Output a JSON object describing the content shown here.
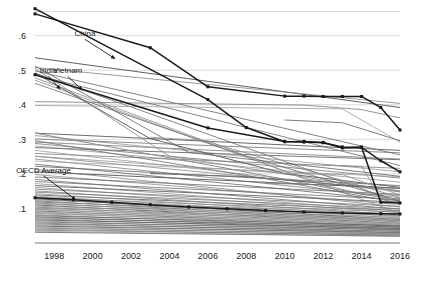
{
  "chart_data": {
    "type": "line",
    "title": "",
    "subtitle": "",
    "xlabel": "",
    "ylabel": "",
    "xlim": [
      1997,
      2016
    ],
    "ylim": [
      0,
      0.68
    ],
    "grid": true,
    "grid_axis": "y",
    "legend_position": "none",
    "annotations_are_inline_labels": true,
    "x": [
      1997,
      1998,
      1999,
      2000,
      2001,
      2002,
      2003,
      2004,
      2005,
      2006,
      2007,
      2008,
      2009,
      2010,
      2011,
      2012,
      2013,
      2014,
      2015,
      2016
    ],
    "xticks": [
      1998,
      2000,
      2002,
      2004,
      2006,
      2008,
      2010,
      2012,
      2014,
      2016
    ],
    "xticklabels": [
      "1998",
      "2000",
      "2002",
      "2004",
      "2006",
      "2008",
      "2010",
      "2012",
      "2014",
      "2016"
    ],
    "yticks": [
      0.1,
      0.2,
      0.3,
      0.4,
      0.5,
      0.6
    ],
    "yticklabels": [
      ".1",
      ".2",
      ".3",
      ".4",
      ".5",
      ".6"
    ],
    "highlight_color": "#1a1a1a",
    "background_color": "#9a9a9a",
    "series": [
      {
        "name": "China",
        "highlight": true,
        "marker": "square",
        "label": "China",
        "label_x": 1999.6,
        "label_y": 0.598,
        "arrow_to_x": 2001.15,
        "arrow_to_y": 0.534,
        "x": [
          1997,
          2003,
          2006,
          2010,
          2011,
          2012,
          2013,
          2014,
          2015,
          2016
        ],
        "values": [
          0.663,
          0.565,
          0.452,
          0.425,
          0.425,
          0.424,
          0.424,
          0.424,
          0.392,
          0.327
        ]
      },
      {
        "name": "Vietnam",
        "highlight": true,
        "marker": "square",
        "label": "Vietnam",
        "label_x": 1998.7,
        "label_y": 0.491,
        "arrow_to_x": 1999.45,
        "arrow_to_y": 0.443,
        "x": [
          1997,
          2006,
          2008,
          2010,
          2011,
          2012,
          2013,
          2014,
          2015,
          2016
        ],
        "values": [
          0.678,
          0.415,
          0.334,
          0.293,
          0.294,
          0.291,
          0.275,
          0.277,
          0.118,
          0.116
        ]
      },
      {
        "name": "India",
        "highlight": true,
        "marker": "square",
        "label": "India",
        "label_x": 1997.7,
        "label_y": 0.492,
        "arrow_to_x": 1998.3,
        "arrow_to_y": 0.446,
        "x": [
          1997,
          2006,
          2010,
          2011,
          2012,
          2013,
          2014,
          2015,
          2016
        ],
        "values": [
          0.487,
          0.333,
          0.294,
          0.292,
          0.29,
          0.278,
          0.277,
          0.238,
          0.206
        ]
      },
      {
        "name": "OECD Average",
        "highlight": true,
        "marker": "square",
        "label": "OECD Average",
        "label_x": 1997.45,
        "label_y": 0.203,
        "arrow_to_x": 1999.1,
        "arrow_to_y": 0.126,
        "x": [
          1997,
          1999,
          2001,
          2003,
          2005,
          2007,
          2009,
          2011,
          2013,
          2015,
          2016
        ],
        "values": [
          0.131,
          0.125,
          0.118,
          0.111,
          0.104,
          0.099,
          0.094,
          0.09,
          0.087,
          0.085,
          0.084
        ]
      }
    ],
    "background_series": [
      {
        "x": [
          1997,
          2016
        ],
        "values": [
          0.536,
          0.392
        ]
      },
      {
        "x": [
          1997,
          2016
        ],
        "values": [
          0.508,
          0.404
        ]
      },
      {
        "x": [
          1997,
          2016
        ],
        "values": [
          0.498,
          0.255
        ]
      },
      {
        "x": [
          1997,
          2016
        ],
        "values": [
          0.492,
          0.118
        ]
      },
      {
        "x": [
          1997,
          2016
        ],
        "values": [
          0.486,
          0.224
        ]
      },
      {
        "x": [
          1997,
          2016
        ],
        "values": [
          0.471,
          0.086
        ]
      },
      {
        "x": [
          1997,
          2016
        ],
        "values": [
          0.318,
          0.268
        ]
      },
      {
        "x": [
          1997,
          2016
        ],
        "values": [
          0.311,
          0.206
        ]
      },
      {
        "x": [
          1997,
          2016
        ],
        "values": [
          0.301,
          0.261
        ]
      },
      {
        "x": [
          1997,
          2016
        ],
        "values": [
          0.292,
          0.243
        ]
      },
      {
        "x": [
          1997,
          2016
        ],
        "values": [
          0.288,
          0.188
        ]
      },
      {
        "x": [
          1997,
          2016
        ],
        "values": [
          0.281,
          0.176
        ]
      },
      {
        "x": [
          1997,
          2016
        ],
        "values": [
          0.276,
          0.241
        ]
      },
      {
        "x": [
          1997,
          2016
        ],
        "values": [
          0.268,
          0.148
        ]
      },
      {
        "x": [
          1997,
          2016
        ],
        "values": [
          0.259,
          0.216
        ]
      },
      {
        "x": [
          1997,
          2016
        ],
        "values": [
          0.251,
          0.151
        ]
      },
      {
        "x": [
          1997,
          2016
        ],
        "values": [
          0.243,
          0.131
        ]
      },
      {
        "x": [
          1997,
          2016
        ],
        "values": [
          0.237,
          0.192
        ]
      },
      {
        "x": [
          1997,
          2016
        ],
        "values": [
          0.228,
          0.122
        ]
      },
      {
        "x": [
          1997,
          2016
        ],
        "values": [
          0.222,
          0.166
        ]
      },
      {
        "x": [
          1997,
          2016
        ],
        "values": [
          0.213,
          0.104
        ]
      },
      {
        "x": [
          1997,
          2016
        ],
        "values": [
          0.206,
          0.158
        ]
      },
      {
        "x": [
          1997,
          2016
        ],
        "values": [
          0.198,
          0.111
        ]
      },
      {
        "x": [
          1997,
          2016
        ],
        "values": [
          0.191,
          0.141
        ]
      },
      {
        "x": [
          1997,
          2016
        ],
        "values": [
          0.184,
          0.098
        ]
      },
      {
        "x": [
          1997,
          2016
        ],
        "values": [
          0.178,
          0.126
        ]
      },
      {
        "x": [
          1997,
          2016
        ],
        "values": [
          0.172,
          0.092
        ]
      },
      {
        "x": [
          1997,
          2016
        ],
        "values": [
          0.166,
          0.118
        ]
      },
      {
        "x": [
          1997,
          2016
        ],
        "values": [
          0.161,
          0.088
        ]
      },
      {
        "x": [
          1997,
          2016
        ],
        "values": [
          0.156,
          0.106
        ]
      },
      {
        "x": [
          1997,
          2016
        ],
        "values": [
          0.151,
          0.081
        ]
      },
      {
        "x": [
          1997,
          2016
        ],
        "values": [
          0.147,
          0.099
        ]
      },
      {
        "x": [
          1997,
          2016
        ],
        "values": [
          0.143,
          0.076
        ]
      },
      {
        "x": [
          1997,
          2016
        ],
        "values": [
          0.139,
          0.094
        ]
      },
      {
        "x": [
          1997,
          2016
        ],
        "values": [
          0.136,
          0.072
        ]
      },
      {
        "x": [
          1997,
          2016
        ],
        "values": [
          0.132,
          0.089
        ]
      },
      {
        "x": [
          1997,
          2016
        ],
        "values": [
          0.128,
          0.068
        ]
      },
      {
        "x": [
          1997,
          2016
        ],
        "values": [
          0.125,
          0.084
        ]
      },
      {
        "x": [
          1997,
          2016
        ],
        "values": [
          0.122,
          0.064
        ]
      },
      {
        "x": [
          1997,
          2016
        ],
        "values": [
          0.119,
          0.079
        ]
      },
      {
        "x": [
          1997,
          2016
        ],
        "values": [
          0.116,
          0.061
        ]
      },
      {
        "x": [
          1997,
          2016
        ],
        "values": [
          0.113,
          0.074
        ]
      },
      {
        "x": [
          1997,
          2016
        ],
        "values": [
          0.11,
          0.057
        ]
      },
      {
        "x": [
          1997,
          2016
        ],
        "values": [
          0.107,
          0.07
        ]
      },
      {
        "x": [
          1997,
          2016
        ],
        "values": [
          0.104,
          0.054
        ]
      },
      {
        "x": [
          1997,
          2016
        ],
        "values": [
          0.101,
          0.066
        ]
      },
      {
        "x": [
          1997,
          2016
        ],
        "values": [
          0.098,
          0.051
        ]
      },
      {
        "x": [
          1997,
          2016
        ],
        "values": [
          0.096,
          0.062
        ]
      },
      {
        "x": [
          1997,
          2016
        ],
        "values": [
          0.093,
          0.048
        ]
      },
      {
        "x": [
          1997,
          2016
        ],
        "values": [
          0.09,
          0.058
        ]
      },
      {
        "x": [
          1997,
          2016
        ],
        "values": [
          0.088,
          0.045
        ]
      },
      {
        "x": [
          1997,
          2016
        ],
        "values": [
          0.085,
          0.054
        ]
      },
      {
        "x": [
          1997,
          2016
        ],
        "values": [
          0.082,
          0.042
        ]
      },
      {
        "x": [
          1997,
          2016
        ],
        "values": [
          0.079,
          0.05
        ]
      },
      {
        "x": [
          1997,
          2016
        ],
        "values": [
          0.076,
          0.039
        ]
      },
      {
        "x": [
          1997,
          2016
        ],
        "values": [
          0.073,
          0.046
        ]
      },
      {
        "x": [
          1997,
          2016
        ],
        "values": [
          0.07,
          0.036
        ]
      },
      {
        "x": [
          1997,
          2016
        ],
        "values": [
          0.067,
          0.042
        ]
      },
      {
        "x": [
          1997,
          2016
        ],
        "values": [
          0.064,
          0.033
        ]
      },
      {
        "x": [
          1997,
          2016
        ],
        "values": [
          0.061,
          0.038
        ]
      },
      {
        "x": [
          1997,
          2016
        ],
        "values": [
          0.058,
          0.03
        ]
      },
      {
        "x": [
          1997,
          2016
        ],
        "values": [
          0.055,
          0.034
        ]
      },
      {
        "x": [
          1997,
          2016
        ],
        "values": [
          0.052,
          0.027
        ]
      },
      {
        "x": [
          1997,
          2016
        ],
        "values": [
          0.049,
          0.03
        ]
      },
      {
        "x": [
          1997,
          2016
        ],
        "values": [
          0.046,
          0.024
        ]
      },
      {
        "x": [
          1997,
          2016
        ],
        "values": [
          0.043,
          0.026
        ]
      },
      {
        "x": [
          1997,
          2016
        ],
        "values": [
          0.04,
          0.021
        ]
      },
      {
        "x": [
          1997,
          2016
        ],
        "values": [
          0.037,
          0.023
        ]
      },
      {
        "x": [
          1997,
          2016
        ],
        "values": [
          0.034,
          0.019
        ]
      },
      {
        "x": [
          1997,
          2016
        ],
        "values": [
          0.031,
          0.02
        ]
      },
      {
        "x": [
          1997,
          2005,
          2016
        ],
        "values": [
          0.512,
          0.262,
          0.193
        ]
      },
      {
        "x": [
          1997,
          2004,
          2016
        ],
        "values": [
          0.505,
          0.251,
          0.148
        ]
      },
      {
        "x": [
          1997,
          2003,
          2010,
          2016
        ],
        "values": [
          0.492,
          0.302,
          0.201,
          0.161
        ]
      },
      {
        "x": [
          1997,
          2006,
          2013,
          2016
        ],
        "values": [
          0.478,
          0.292,
          0.181,
          0.132
        ]
      },
      {
        "x": [
          1997,
          2008,
          2016
        ],
        "values": [
          0.462,
          0.251,
          0.121
        ]
      },
      {
        "x": [
          1997,
          2007,
          2014,
          2016
        ],
        "values": [
          0.318,
          0.216,
          0.141,
          0.126
        ]
      },
      {
        "x": [
          1997,
          2009,
          2016
        ],
        "values": [
          0.296,
          0.186,
          0.116
        ]
      },
      {
        "x": [
          2003,
          2006,
          2011,
          2016
        ],
        "values": [
          0.306,
          0.296,
          0.186,
          0.151
        ]
      },
      {
        "x": [
          2003,
          2008,
          2013,
          2016
        ],
        "values": [
          0.201,
          0.192,
          0.168,
          0.158
        ]
      },
      {
        "x": [
          1997,
          2010,
          2013,
          2016
        ],
        "values": [
          0.251,
          0.202,
          0.198,
          0.139
        ]
      },
      {
        "x": [
          2009,
          2012,
          2014,
          2016
        ],
        "values": [
          0.173,
          0.168,
          0.142,
          0.138
        ]
      },
      {
        "x": [
          2012,
          2014,
          2015,
          2016
        ],
        "values": [
          0.226,
          0.222,
          0.131,
          0.128
        ]
      },
      {
        "x": [
          1997,
          2011,
          2014,
          2016
        ],
        "values": [
          0.409,
          0.399,
          0.386,
          0.362
        ]
      },
      {
        "x": [
          1997,
          2013,
          2016
        ],
        "values": [
          0.398,
          0.388,
          0.292
        ]
      },
      {
        "x": [
          2010,
          2013,
          2016
        ],
        "values": [
          0.356,
          0.348,
          0.296
        ]
      }
    ]
  },
  "annotations": [
    {
      "id": "china",
      "text": "China"
    },
    {
      "id": "india",
      "text": "India"
    },
    {
      "id": "vietnam",
      "text": "Vietnam"
    },
    {
      "id": "oecd",
      "text": "OECD Average"
    }
  ]
}
